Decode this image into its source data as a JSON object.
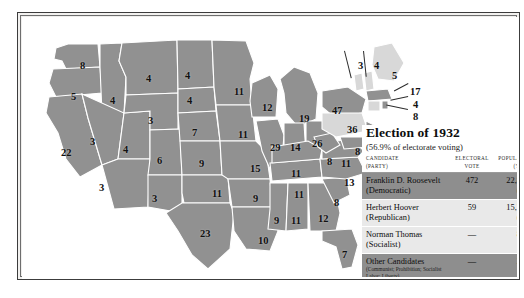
{
  "map": {
    "title": "Election of 1932",
    "subtitle": "(56.9% of electorate voting)",
    "columns": {
      "candidate": "CANDIDATE",
      "candidate_sub": "(PARTY)",
      "electoral": "ELECTORAL",
      "electoral_sub": "VOTE",
      "popular": "POPULAR VOT",
      "popular_sub": "(%)"
    },
    "rows": [
      {
        "name": "Franklin D. Roosevelt",
        "party": "(Democratic)",
        "electoral": "472",
        "popular": "22,821,857",
        "percent": "(57.4%)",
        "shade": "dark"
      },
      {
        "name": "Herbert Hoover",
        "party": "(Republican)",
        "electoral": "59",
        "popular": "15,761,841",
        "percent": "(39.7%)",
        "shade": "light"
      },
      {
        "name": "Norman Thomas",
        "party": "(Socialist)",
        "electoral": "—",
        "popular": "881,951",
        "percent": "(2.2%)",
        "shade": "light"
      },
      {
        "name": "Other Candidates",
        "party": "",
        "note": "(Communist; Prohibition; Socialist Labor; Liberty)",
        "electoral": "—",
        "popular": "271,355",
        "percent": "(0.7%)",
        "shade": "dark"
      }
    ],
    "states": [
      {
        "code": "WA",
        "votes": "8",
        "x": 58,
        "y": 44,
        "winner": "roosevelt"
      },
      {
        "code": "OR",
        "votes": "5",
        "x": 49,
        "y": 75,
        "winner": "roosevelt"
      },
      {
        "code": "CA",
        "votes": "22",
        "x": 39,
        "y": 131,
        "winner": "roosevelt"
      },
      {
        "code": "ID",
        "votes": "4",
        "x": 88,
        "y": 79,
        "winner": "roosevelt"
      },
      {
        "code": "NV",
        "votes": "3",
        "x": 68,
        "y": 120,
        "winner": "roosevelt"
      },
      {
        "code": "UT",
        "votes": "4",
        "x": 101,
        "y": 128,
        "winner": "roosevelt"
      },
      {
        "code": "AZ",
        "votes": "3",
        "x": 77,
        "y": 166,
        "winner": "roosevelt"
      },
      {
        "code": "MT",
        "votes": "4",
        "x": 124,
        "y": 57,
        "winner": "roosevelt"
      },
      {
        "code": "WY",
        "votes": "3",
        "x": 126,
        "y": 99,
        "winner": "roosevelt"
      },
      {
        "code": "CO",
        "votes": "6",
        "x": 135,
        "y": 139,
        "winner": "roosevelt"
      },
      {
        "code": "NM",
        "votes": "3",
        "x": 130,
        "y": 177,
        "winner": "roosevelt"
      },
      {
        "code": "ND",
        "votes": "4",
        "x": 163,
        "y": 54,
        "winner": "roosevelt"
      },
      {
        "code": "SD",
        "votes": "4",
        "x": 165,
        "y": 79,
        "winner": "roosevelt"
      },
      {
        "code": "NE",
        "votes": "7",
        "x": 170,
        "y": 111,
        "winner": "roosevelt"
      },
      {
        "code": "KS",
        "votes": "9",
        "x": 177,
        "y": 142,
        "winner": "roosevelt"
      },
      {
        "code": "OK",
        "votes": "11",
        "x": 190,
        "y": 172,
        "winner": "roosevelt"
      },
      {
        "code": "TX",
        "votes": "23",
        "x": 178,
        "y": 212,
        "winner": "roosevelt"
      },
      {
        "code": "MN",
        "votes": "11",
        "x": 212,
        "y": 70,
        "winner": "roosevelt"
      },
      {
        "code": "IA",
        "votes": "11",
        "x": 216,
        "y": 113,
        "winner": "roosevelt"
      },
      {
        "code": "MO",
        "votes": "15",
        "x": 228,
        "y": 147,
        "winner": "roosevelt"
      },
      {
        "code": "AR",
        "votes": "9",
        "x": 231,
        "y": 177,
        "winner": "roosevelt"
      },
      {
        "code": "LA",
        "votes": "10",
        "x": 236,
        "y": 219,
        "winner": "roosevelt"
      },
      {
        "code": "WI",
        "votes": "12",
        "x": 240,
        "y": 86,
        "winner": "roosevelt"
      },
      {
        "code": "MI",
        "votes": "19",
        "x": 277,
        "y": 97,
        "winner": "roosevelt"
      },
      {
        "code": "IL",
        "votes": "29",
        "x": 248,
        "y": 126,
        "winner": "roosevelt"
      },
      {
        "code": "IN",
        "votes": "14",
        "x": 268,
        "y": 126,
        "winner": "roosevelt"
      },
      {
        "code": "OH",
        "votes": "26",
        "x": 290,
        "y": 122,
        "winner": "roosevelt"
      },
      {
        "code": "MS",
        "votes": "9",
        "x": 252,
        "y": 199,
        "winner": "roosevelt"
      },
      {
        "code": "AL",
        "votes": "11",
        "x": 269,
        "y": 199,
        "winner": "roosevelt"
      },
      {
        "code": "TN",
        "votes": "11",
        "x": 269,
        "y": 152,
        "winner": "roosevelt"
      },
      {
        "code": "KY",
        "votes": "11",
        "x": 272,
        "y": 173,
        "winner": "roosevelt"
      },
      {
        "code": "GA",
        "votes": "12",
        "x": 296,
        "y": 197,
        "winner": "roosevelt"
      },
      {
        "code": "FL",
        "votes": "7",
        "x": 320,
        "y": 233,
        "winner": "roosevelt"
      },
      {
        "code": "SC",
        "votes": "8",
        "x": 312,
        "y": 181,
        "winner": "roosevelt"
      },
      {
        "code": "NC",
        "votes": "13",
        "x": 322,
        "y": 161,
        "winner": "roosevelt"
      },
      {
        "code": "VA",
        "votes": "11",
        "x": 319,
        "y": 142,
        "winner": "roosevelt"
      },
      {
        "code": "WV",
        "votes": "8",
        "x": 305,
        "y": 140,
        "winner": "roosevelt"
      },
      {
        "code": "NY",
        "votes": "47",
        "x": 310,
        "y": 89,
        "winner": "roosevelt"
      },
      {
        "code": "PA",
        "votes": "36",
        "x": 325,
        "y": 108,
        "winner": "hoover"
      },
      {
        "code": "NJ",
        "votes": "16",
        "x": 350,
        "y": 117,
        "winner": "roosevelt"
      },
      {
        "code": "MD",
        "votes": "8",
        "x": 333,
        "y": 130,
        "winner": "roosevelt"
      },
      {
        "code": "DE",
        "votes": "3",
        "x": 344,
        "y": 131,
        "winner": "hoover"
      },
      {
        "code": "VT",
        "votes": "3",
        "x": 336,
        "y": 44,
        "winner": "hoover"
      },
      {
        "code": "NH",
        "votes": "4",
        "x": 352,
        "y": 44,
        "winner": "hoover"
      },
      {
        "code": "ME",
        "votes": "5",
        "x": 370,
        "y": 54,
        "winner": "hoover"
      },
      {
        "code": "MA",
        "votes": "17",
        "x": 388,
        "y": 70,
        "winner": "roosevelt"
      },
      {
        "code": "RI",
        "votes": "4",
        "x": 391,
        "y": 83,
        "winner": "roosevelt"
      },
      {
        "code": "CT",
        "votes": "8",
        "x": 391,
        "y": 95,
        "winner": "hoover"
      }
    ]
  }
}
